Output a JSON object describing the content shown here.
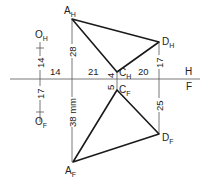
{
  "diagram": {
    "type": "orthographic-projection",
    "fold_line": {
      "top_label": "H",
      "bottom_label": "F"
    },
    "points": {
      "A_H": {
        "label": "A",
        "sub": "H"
      },
      "D_H": {
        "label": "D",
        "sub": "H"
      },
      "C_H": {
        "label": "C",
        "sub": "H"
      },
      "C_F": {
        "label": "C",
        "sub": "F"
      },
      "D_F": {
        "label": "D",
        "sub": "F"
      },
      "A_F": {
        "label": "A",
        "sub": "F"
      },
      "O_H": {
        "label": "O",
        "sub": "H"
      },
      "O_F": {
        "label": "O",
        "sub": "F"
      }
    },
    "dimensions": {
      "o_h_height": "14",
      "o_f_depth": "17",
      "o_to_a_horizontal": "14",
      "a_to_c_horizontal": "21",
      "c_to_d_horizontal": "20",
      "a_h_height": "28",
      "c_h_height": "4",
      "d_h_height": "17",
      "c_f_depth": "5",
      "d_f_depth": "25",
      "a_f_depth": "38 mm"
    }
  }
}
